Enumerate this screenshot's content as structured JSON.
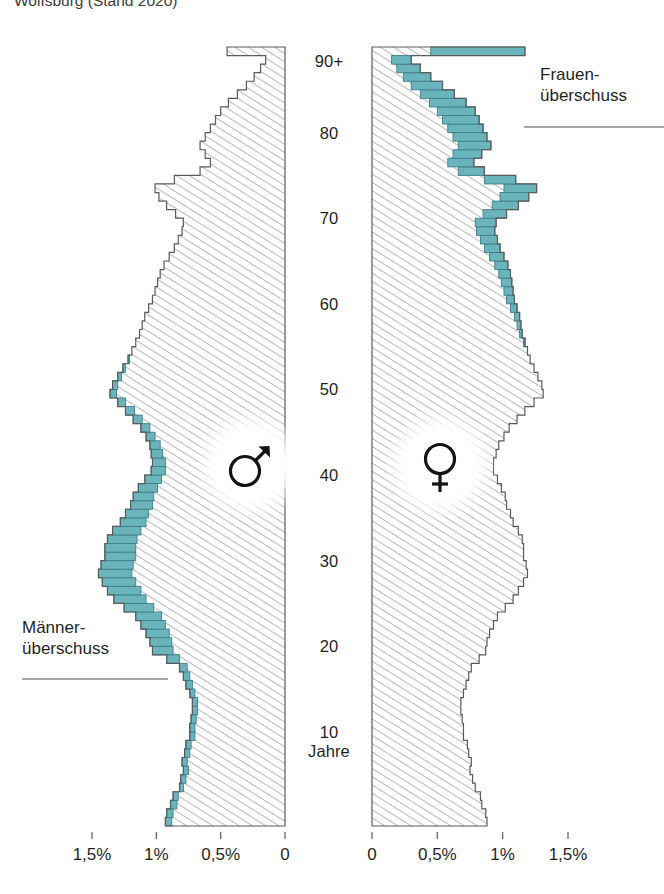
{
  "title": "Wolfsburg (Stand 2020)",
  "chart_data": {
    "type": "bar",
    "subtype": "population-pyramid",
    "title": "Wolfsburg (Stand 2020)",
    "xlabel": "",
    "ylabel": "Jahre",
    "unit": "%",
    "xlim": [
      0,
      1.7
    ],
    "ylim": [
      0,
      90
    ],
    "grid": false,
    "legend_position": "none",
    "orientation": "horizontal-mirrored",
    "age_axis": {
      "label": "Jahre",
      "ticks": [
        "10",
        "20",
        "30",
        "40",
        "50",
        "60",
        "70",
        "80",
        "90+"
      ],
      "tick_values": [
        10,
        20,
        30,
        40,
        50,
        60,
        70,
        80,
        90
      ],
      "top_category": "90+"
    },
    "x_axis_left": {
      "ticks": [
        "1,5%",
        "1%",
        "0,5%",
        "0"
      ],
      "tick_values": [
        1.5,
        1.0,
        0.5,
        0
      ],
      "direction": "right-to-left"
    },
    "x_axis_right": {
      "ticks": [
        "0",
        "0,5%",
        "1%",
        "1,5%"
      ],
      "tick_values": [
        0,
        0.5,
        1.0,
        1.5
      ],
      "direction": "left-to-right"
    },
    "colors": {
      "surplus_fill": "#6cb4bc",
      "surplus_stroke": "#3d7f88",
      "hatch_line": "#7d7d7d",
      "bar_outline": "#5a5a5a",
      "text": "#1f1f1f"
    },
    "series": [
      {
        "name": "Männer",
        "symbol": "♂",
        "side": "left",
        "annotation": "Männer-überschuss",
        "ages": [
          0,
          1,
          2,
          3,
          4,
          5,
          6,
          7,
          8,
          9,
          10,
          11,
          12,
          13,
          14,
          15,
          16,
          17,
          18,
          19,
          20,
          21,
          22,
          23,
          24,
          25,
          26,
          27,
          28,
          29,
          30,
          31,
          32,
          33,
          34,
          35,
          36,
          37,
          38,
          39,
          40,
          41,
          42,
          43,
          44,
          45,
          46,
          47,
          48,
          49,
          50,
          51,
          52,
          53,
          54,
          55,
          56,
          57,
          58,
          59,
          60,
          61,
          62,
          63,
          64,
          65,
          66,
          67,
          68,
          69,
          70,
          71,
          72,
          73,
          74,
          75,
          76,
          77,
          78,
          79,
          80,
          81,
          82,
          83,
          84,
          85,
          86,
          87,
          88,
          89,
          90
        ],
        "values": [
          0.93,
          0.92,
          0.89,
          0.87,
          0.82,
          0.81,
          0.79,
          0.8,
          0.78,
          0.77,
          0.74,
          0.74,
          0.73,
          0.72,
          0.72,
          0.74,
          0.77,
          0.79,
          0.82,
          0.92,
          1.03,
          1.05,
          1.08,
          1.12,
          1.16,
          1.25,
          1.33,
          1.38,
          1.42,
          1.45,
          1.43,
          1.4,
          1.4,
          1.38,
          1.34,
          1.28,
          1.24,
          1.2,
          1.18,
          1.14,
          1.09,
          1.04,
          1.03,
          1.04,
          1.05,
          1.08,
          1.12,
          1.18,
          1.24,
          1.3,
          1.36,
          1.34,
          1.3,
          1.26,
          1.22,
          1.19,
          1.16,
          1.13,
          1.11,
          1.09,
          1.06,
          1.03,
          1.01,
          0.99,
          0.97,
          0.94,
          0.9,
          0.86,
          0.83,
          0.8,
          0.79,
          0.85,
          0.92,
          0.98,
          1.01,
          0.86,
          0.66,
          0.58,
          0.62,
          0.66,
          0.62,
          0.58,
          0.54,
          0.5,
          0.44,
          0.37,
          0.3,
          0.24,
          0.19,
          0.15,
          0.45
        ]
      },
      {
        "name": "Frauen",
        "symbol": "♀",
        "side": "right",
        "annotation": "Frauen-überschuss",
        "ages": [
          0,
          1,
          2,
          3,
          4,
          5,
          6,
          7,
          8,
          9,
          10,
          11,
          12,
          13,
          14,
          15,
          16,
          17,
          18,
          19,
          20,
          21,
          22,
          23,
          24,
          25,
          26,
          27,
          28,
          29,
          30,
          31,
          32,
          33,
          34,
          35,
          36,
          37,
          38,
          39,
          40,
          41,
          42,
          43,
          44,
          45,
          46,
          47,
          48,
          49,
          50,
          51,
          52,
          53,
          54,
          55,
          56,
          57,
          58,
          59,
          60,
          61,
          62,
          63,
          64,
          65,
          66,
          67,
          68,
          69,
          70,
          71,
          72,
          73,
          74,
          75,
          76,
          77,
          78,
          79,
          80,
          81,
          82,
          83,
          84,
          85,
          86,
          87,
          88,
          89,
          90
        ],
        "values": [
          0.88,
          0.87,
          0.84,
          0.83,
          0.79,
          0.77,
          0.75,
          0.76,
          0.74,
          0.73,
          0.7,
          0.7,
          0.69,
          0.68,
          0.68,
          0.7,
          0.72,
          0.74,
          0.76,
          0.82,
          0.87,
          0.88,
          0.9,
          0.93,
          0.96,
          1.02,
          1.08,
          1.12,
          1.16,
          1.19,
          1.18,
          1.16,
          1.16,
          1.15,
          1.12,
          1.08,
          1.06,
          1.03,
          1.02,
          0.99,
          0.96,
          0.93,
          0.93,
          0.95,
          0.97,
          1.01,
          1.05,
          1.11,
          1.17,
          1.24,
          1.31,
          1.3,
          1.27,
          1.24,
          1.21,
          1.19,
          1.17,
          1.15,
          1.14,
          1.13,
          1.11,
          1.09,
          1.08,
          1.07,
          1.06,
          1.04,
          1.01,
          0.98,
          0.96,
          0.94,
          0.95,
          1.03,
          1.12,
          1.2,
          1.26,
          1.1,
          0.86,
          0.78,
          0.84,
          0.91,
          0.88,
          0.85,
          0.82,
          0.79,
          0.72,
          0.63,
          0.54,
          0.45,
          0.37,
          0.3,
          1.17
        ]
      }
    ],
    "annotations": [
      {
        "text": "Frauen-überschuss",
        "lines": [
          "Frauen-",
          "überschuss"
        ],
        "side": "right",
        "points_to_age": 83
      },
      {
        "text": "Männer-überschuss",
        "lines": [
          "Männer-",
          "überschuss"
        ],
        "side": "left",
        "points_to_age": 19
      }
    ]
  },
  "age_axis_labels": [
    {
      "text": "90+",
      "value": 90
    },
    {
      "text": "80",
      "value": 80
    },
    {
      "text": "70",
      "value": 70
    },
    {
      "text": "60",
      "value": 60
    },
    {
      "text": "50",
      "value": 50
    },
    {
      "text": "40",
      "value": 40
    },
    {
      "text": "30",
      "value": 30
    },
    {
      "text": "20",
      "value": 20
    },
    {
      "text": "10",
      "value": 10
    }
  ],
  "age_unit_label": "Jahre",
  "tick_labels_left": [
    "1,5%",
    "1%",
    "0,5%",
    "0"
  ],
  "tick_labels_right": [
    "0",
    "0,5%",
    "1%",
    "1,5%"
  ],
  "symbols": {
    "male": "♂",
    "female": "♀"
  },
  "annotation_frauen": {
    "line1": "Frauen-",
    "line2": "überschuss"
  },
  "annotation_maenner": {
    "line1": "Männer-",
    "line2": "überschuss"
  }
}
